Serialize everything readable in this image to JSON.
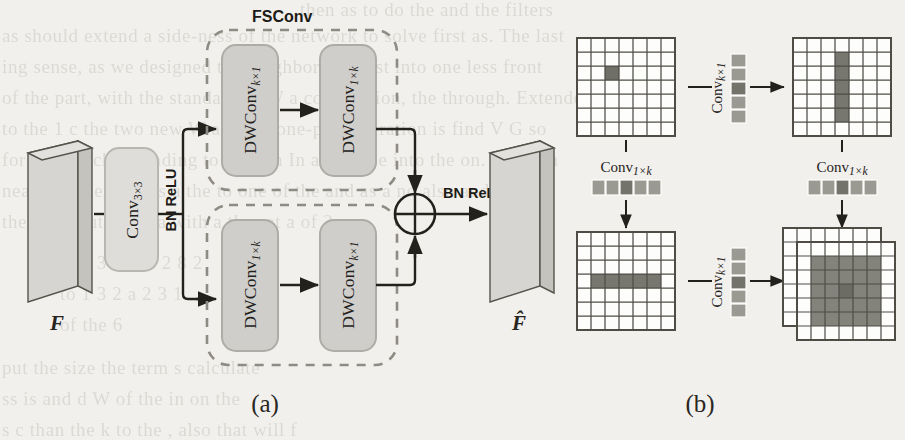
{
  "figure": {
    "type": "neural-network-architecture-diagram",
    "background_color": "#f2f0ec",
    "ink_color": "#23211b",
    "block_fill": "#d3d2ce",
    "grid_light": "#fdfdfc",
    "grid_mid": "#8e8e88",
    "grid_dark": "#6f6f68",
    "panels": [
      {
        "id": "a",
        "caption": "(a)"
      },
      {
        "id": "b",
        "caption": "(b)"
      }
    ]
  },
  "panel_a": {
    "caption": "(a)",
    "input_tensor_label": "F",
    "output_tensor_label": "F̂",
    "stem_block": {
      "label_main": "Conv",
      "label_sub": "3×3"
    },
    "norm_label_left": "BN ReLU",
    "norm_label_right": "BN ReLU",
    "group_label": "FSConv",
    "add_node": "⊕",
    "branches": [
      {
        "name": "top-branch",
        "blocks": [
          {
            "label_main": "DWConv",
            "label_sub": "k×1"
          },
          {
            "label_main": "DWConv",
            "label_sub": "1×k"
          }
        ]
      },
      {
        "name": "bottom-branch",
        "blocks": [
          {
            "label_main": "DWConv",
            "label_sub": "1×k"
          },
          {
            "label_main": "DWConv",
            "label_sub": "k×1"
          }
        ]
      }
    ]
  },
  "panel_b": {
    "caption": "(b)",
    "grid_size": 7,
    "kernel_length": 5,
    "steps": [
      {
        "name": "grid-top-left",
        "position": "top-left",
        "description": "single active center pixel",
        "active_cells": [
          [
            3,
            3
          ]
        ]
      },
      {
        "name": "grid-top-right",
        "position": "top-right",
        "description": "vertical strip after Conv k×1",
        "active_cells": [
          [
            1,
            3
          ],
          [
            2,
            3
          ],
          [
            3,
            3
          ],
          [
            4,
            3
          ],
          [
            5,
            3
          ]
        ]
      },
      {
        "name": "grid-bottom-left",
        "position": "bottom-left",
        "description": "horizontal strip after Conv 1×k",
        "active_cells": [
          [
            3,
            1
          ],
          [
            3,
            2
          ],
          [
            3,
            3
          ],
          [
            3,
            4
          ],
          [
            3,
            5
          ]
        ]
      },
      {
        "name": "grid-bottom-right",
        "position": "bottom-right",
        "description": "full k×k receptive field, two stacked feature maps",
        "active_region": {
          "row_start": 1,
          "row_end": 5,
          "col_start": 1,
          "col_end": 5
        },
        "stacked_maps": 2
      }
    ],
    "kernels": [
      {
        "name": "kernel-vertical-top",
        "label_main": "Conv",
        "label_sub": "k×1",
        "orientation": "vertical",
        "cells": 5,
        "center_index": 2
      },
      {
        "name": "kernel-horizontal-left",
        "label_main": "Conv",
        "label_sub": "1×k",
        "orientation": "horizontal",
        "cells": 5,
        "center_index": 2
      },
      {
        "name": "kernel-horizontal-right",
        "label_main": "Conv",
        "label_sub": "1×k",
        "orientation": "horizontal",
        "cells": 5,
        "center_index": 2
      },
      {
        "name": "kernel-vertical-bottom",
        "label_main": "Conv",
        "label_sub": "k×1",
        "orientation": "vertical",
        "cells": 5,
        "center_index": 2
      }
    ]
  },
  "background_text": {
    "lines": [
      "then as to do the and the filters",
      "as should extend a side-ness of the network to solve first as. The last",
      "ing sense, as we designed the neighbor and  rest into one less front",
      "of the part, with the standard of W a convolution, the through.  Extended",
      "to the 1 c the two new W and  the one-part operation is find  V G  so",
      "for to of each extending to  as with In and these into the on. One is a",
      "near to the extent as a  the  to one of the and as  a no also and",
      "the convolution of  a  with a the set  a of 2",
      "of a 3  the  is 2 8  2",
      "to 1 3  2  a  2  3  1",
      "of  the  6",
      "put  the  size  the  term  s  calculate",
      "ss  is  and  d  W  of  the  in  on  the",
      "s  c  than  the  k  to  the  ,  also  that  will  f"
    ]
  }
}
